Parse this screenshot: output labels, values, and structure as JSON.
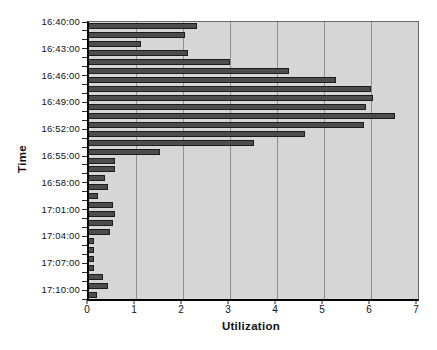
{
  "chart_data": {
    "type": "bar",
    "orientation": "horizontal",
    "title": "",
    "xlabel": "Utilization",
    "ylabel": "Time",
    "xlim": [
      0,
      7
    ],
    "grid": true,
    "legend": "none",
    "x_tick_labels": [
      "0",
      "1",
      "2",
      "3",
      "4",
      "5",
      "6",
      "7"
    ],
    "y_tick_labels": [
      "16:40:00",
      "16:43:00",
      "16:46:00",
      "16:49:00",
      "16:52:00",
      "16:55:00",
      "16:58:00",
      "17:01:00",
      "17:04:00",
      "17:07:00",
      "17:10:00"
    ],
    "bars_per_y_label": 3,
    "values": [
      2.3,
      2.05,
      1.1,
      2.1,
      3.0,
      4.25,
      5.25,
      6.0,
      6.05,
      5.9,
      6.5,
      5.85,
      4.6,
      3.5,
      1.5,
      0.55,
      0.55,
      0.35,
      0.4,
      0.2,
      0.5,
      0.55,
      0.5,
      0.45,
      0.1,
      0.1,
      0.1,
      0.1,
      0.3,
      0.4,
      0.18
    ],
    "colors": {
      "page_bg": "#ffffff",
      "plot_bg": "#d6d6d6",
      "bar": "#4d4d4d",
      "bar_border": "#1c1c1c",
      "gridline": "#8f8f8f",
      "axis": "#000000",
      "text": "#111111"
    }
  }
}
